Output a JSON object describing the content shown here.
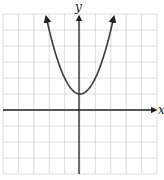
{
  "chart_data": {
    "type": "line",
    "title": "",
    "xlabel": "x",
    "ylabel": "y",
    "xlim": [
      -5,
      5
    ],
    "ylim": [
      -4,
      6
    ],
    "grid": true,
    "grid_step": 1,
    "tick_labels": false,
    "series": [
      {
        "name": "parabola",
        "function": "y = x^2 + 1",
        "vertex": [
          0,
          1
        ],
        "x": [
          -2.2,
          -2,
          -1.5,
          -1,
          -0.5,
          0,
          0.5,
          1,
          1.5,
          2,
          2.2
        ],
        "y": [
          5.84,
          5,
          3.25,
          2,
          1.25,
          1,
          1.25,
          2,
          3.25,
          5,
          5.84
        ],
        "arrows_at_ends": true
      }
    ],
    "legend": null
  },
  "axes": {
    "x_label": "x",
    "y_label": "y"
  },
  "colors": {
    "grid": "#d4d4d4",
    "axis": "#222222",
    "curve": "#3a3a3a"
  }
}
